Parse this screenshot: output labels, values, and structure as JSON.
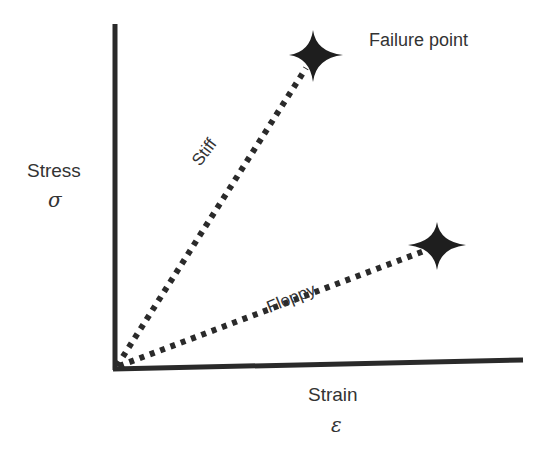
{
  "diagram": {
    "y_axis": {
      "label": "Stress",
      "symbol": "σ"
    },
    "x_axis": {
      "label": "Strain",
      "symbol": "ε"
    },
    "annotations": {
      "failure_point": "Failure point"
    },
    "lines": [
      {
        "name": "Stiff",
        "label": "Stiff",
        "style": "dotted",
        "from": [
          114,
          368
        ],
        "to": [
          313,
          55
        ]
      },
      {
        "name": "Floppy",
        "label": "Floppy",
        "style": "dotted",
        "from": [
          114,
          368
        ],
        "to": [
          437,
          247
        ]
      }
    ],
    "markers": [
      {
        "name": "stiff-failure-star",
        "icon": "four-point-star",
        "at": [
          313,
          55
        ]
      },
      {
        "name": "floppy-failure-star",
        "icon": "four-point-star",
        "at": [
          437,
          247
        ]
      }
    ],
    "colors": {
      "ink": "#2a2a2a",
      "background": "#ffffff"
    }
  }
}
